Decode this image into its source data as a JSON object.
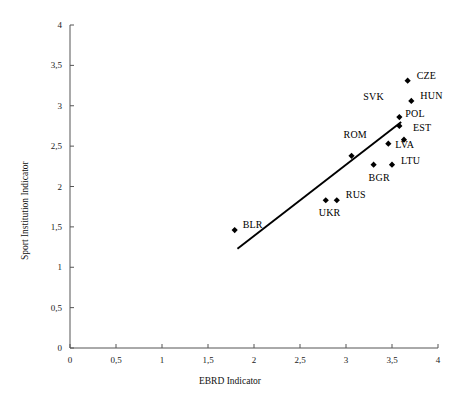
{
  "chart_data": {
    "type": "scatter",
    "title": "",
    "xlabel": "EBRD Indicator",
    "ylabel": "Sport Institution Indicator",
    "xlim": [
      0,
      4
    ],
    "ylim": [
      0,
      4
    ],
    "grid": false,
    "legend": "none",
    "xticks": [
      "0",
      "0,5",
      "1",
      "1,5",
      "2",
      "2,5",
      "3",
      "3,5",
      "4"
    ],
    "xtick_values": [
      0,
      0.5,
      1,
      1.5,
      2,
      2.5,
      3,
      3.5,
      4
    ],
    "yticks": [
      "0",
      "0,5",
      "1",
      "1,5",
      "2",
      "2,5",
      "3",
      "3,5",
      "4"
    ],
    "ytick_values": [
      0,
      0.5,
      1,
      1.5,
      2,
      2.5,
      3,
      3.5,
      4
    ],
    "marker": "diamond",
    "marker_color": "#000000",
    "points": [
      {
        "label": "CZE",
        "x": 3.67,
        "y": 3.31,
        "label_dx": 9,
        "label_dy": -5
      },
      {
        "label": "HUN",
        "x": 3.71,
        "y": 3.06,
        "label_dx": 9,
        "label_dy": -5
      },
      {
        "label": "SVK",
        "x": 3.58,
        "y": 2.86,
        "label_dx": -36,
        "label_dy": -20
      },
      {
        "label": "POL",
        "x": 3.58,
        "y": 2.75,
        "label_dx": 6,
        "label_dy": -12
      },
      {
        "label": "EST",
        "x": 3.63,
        "y": 2.58,
        "label_dx": 9,
        "label_dy": -12
      },
      {
        "label": "LVA",
        "x": 3.46,
        "y": 2.53,
        "label_dx": 7,
        "label_dy": 1
      },
      {
        "label": "ROM",
        "x": 3.06,
        "y": 2.38,
        "label_dx": -8,
        "label_dy": -21
      },
      {
        "label": "LTU",
        "x": 3.5,
        "y": 2.27,
        "label_dx": 9,
        "label_dy": -4
      },
      {
        "label": "BGR",
        "x": 3.3,
        "y": 2.27,
        "label_dx": -5,
        "label_dy": 13
      },
      {
        "label": "RUS",
        "x": 2.9,
        "y": 1.83,
        "label_dx": 9,
        "label_dy": -5
      },
      {
        "label": "UKR",
        "x": 2.78,
        "y": 1.83,
        "label_dx": -7,
        "label_dy": 13
      },
      {
        "label": "BLR",
        "x": 1.79,
        "y": 1.46,
        "label_dx": 8,
        "label_dy": -5
      }
    ],
    "trendline": {
      "x0": 1.82,
      "y0": 1.23,
      "x1": 3.6,
      "y1": 2.8,
      "color": "#000000"
    }
  }
}
